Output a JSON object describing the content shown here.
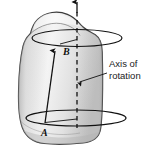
{
  "figure": {
    "title_visible": false,
    "background_color": "#ffffff",
    "solid": {
      "name": "rotating-rigid-body",
      "fill_light": "#f2f2f2",
      "fill_mid": "#d2d2d2",
      "fill_dark": "#a8a8a8",
      "outline_color": "#3a3a3a"
    },
    "axis": {
      "label_line_1": "Axis of",
      "label_line_2": "rotation",
      "stroke_color": "#111111",
      "style": "dashed"
    },
    "points": [
      {
        "id": "point-a",
        "label": "A",
        "x": 44,
        "y": 129
      },
      {
        "id": "point-b",
        "label": "B",
        "x": 66,
        "y": 51
      }
    ],
    "circles": [
      {
        "id": "upper-circular-path",
        "cx": 77,
        "cy": 38,
        "rx": 45,
        "ry": 8.5
      },
      {
        "id": "lower-circular-path",
        "cx": 76,
        "cy": 118,
        "rx": 50,
        "ry": 8
      }
    ],
    "arrows": [
      {
        "id": "axis-direction-arrow",
        "direction": "up"
      },
      {
        "id": "radius-vector-arrow",
        "from": "A",
        "to": "B"
      },
      {
        "id": "callout-leader-arrow",
        "target": "axis"
      }
    ]
  }
}
